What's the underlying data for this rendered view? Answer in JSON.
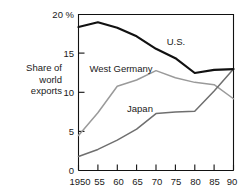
{
  "chart_data": {
    "type": "line",
    "title": "",
    "xlabel": "",
    "ylabel": "Share of world exports",
    "ylabel_lines": [
      "Share of",
      "world",
      "exports"
    ],
    "x": [
      1950,
      1955,
      1960,
      1965,
      1970,
      1975,
      1980,
      1985,
      1990
    ],
    "xtick_labels": [
      "1950",
      "55",
      "60",
      "65",
      "70",
      "75",
      "80",
      "85",
      "90"
    ],
    "ytick_labels": [
      "20 %",
      "15",
      "10",
      "5",
      "0"
    ],
    "ytick_values": [
      20,
      15,
      10,
      5,
      0
    ],
    "ylim": [
      0,
      20
    ],
    "xlim": [
      1950,
      1990
    ],
    "grid": false,
    "legend_position": "inline-annotations",
    "series": [
      {
        "name": "U.S.",
        "color": "#111111",
        "width": 2.2,
        "values": [
          18.4,
          19.0,
          18.3,
          17.2,
          15.6,
          14.4,
          12.5,
          12.9,
          13.0
        ]
      },
      {
        "name": "West Germany",
        "color": "#9a9a9a",
        "width": 1.5,
        "values": [
          4.5,
          7.4,
          10.8,
          11.6,
          12.8,
          11.9,
          11.3,
          11.0,
          9.2
        ]
      },
      {
        "name": "Japan",
        "color": "#6f6f6f",
        "width": 1.5,
        "values": [
          1.8,
          2.7,
          3.9,
          5.3,
          7.3,
          7.5,
          7.6,
          10.2,
          13.0
        ]
      }
    ],
    "annotations": [
      {
        "text": "U.S.",
        "x": 1973,
        "y": 16.9
      },
      {
        "text": "West Germany",
        "x": 1960.5,
        "y": 13.4
      },
      {
        "text": "Japan",
        "x": 1968.5,
        "y": 8.2
      }
    ]
  }
}
